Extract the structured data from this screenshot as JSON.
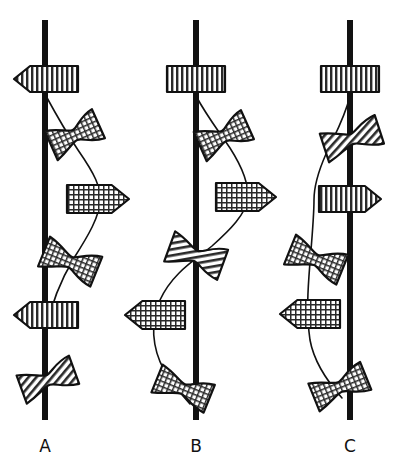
{
  "figure": {
    "type": "diagram",
    "title": "",
    "background_color": "#ffffff",
    "line_color": "#111111",
    "width": 398,
    "height": 464,
    "columns": [
      {
        "id": "A",
        "label": "A",
        "label_x": 45,
        "label_y": 452,
        "axis": {
          "x": 45,
          "y_top": 20,
          "y_bottom": 420,
          "width": 6
        },
        "elements": [
          {
            "name": "banded-block-left-arrow",
            "shape": "left-arrow-block",
            "pattern": "vertical-stripes",
            "cx": 46,
            "cy": 79,
            "w": 64,
            "h": 26,
            "rotate": 0
          },
          {
            "name": "grid-bowtie-upper",
            "shape": "bowtie",
            "pattern": "grid",
            "cx": 75,
            "cy": 135,
            "w": 52,
            "h": 32,
            "rotate": -24
          },
          {
            "name": "grid-block-right-arrow",
            "shape": "right-arrow-block",
            "pattern": "grid",
            "cx": 98,
            "cy": 199,
            "w": 62,
            "h": 28,
            "rotate": 0
          },
          {
            "name": "grid-bowtie-lower",
            "shape": "bowtie",
            "pattern": "grid",
            "cx": 70,
            "cy": 262,
            "w": 56,
            "h": 32,
            "rotate": 22
          },
          {
            "name": "banded-block-left-arrow-lower",
            "shape": "left-arrow-block",
            "pattern": "vertical-stripes",
            "cx": 46,
            "cy": 315,
            "w": 64,
            "h": 26,
            "rotate": 0
          },
          {
            "name": "hatched-bowtie-bottom",
            "shape": "bowtie",
            "pattern": "diagonal-hatch",
            "cx": 48,
            "cy": 380,
            "w": 56,
            "h": 30,
            "rotate": -20
          }
        ],
        "curve": "M 46 96 C 58 118, 66 132, 78 150 C 96 176, 100 186, 100 200 C 100 216, 88 236, 74 258 C 62 278, 52 300, 46 330 C 42 352, 42 368, 46 395"
      },
      {
        "id": "B",
        "label": "B",
        "label_x": 196,
        "label_y": 452,
        "axis": {
          "x": 196,
          "y_top": 20,
          "y_bottom": 420,
          "width": 6
        },
        "elements": [
          {
            "name": "banded-block-plain",
            "shape": "block",
            "pattern": "vertical-stripes",
            "cx": 196,
            "cy": 79,
            "w": 58,
            "h": 26,
            "rotate": 0
          },
          {
            "name": "grid-bowtie-upper",
            "shape": "bowtie",
            "pattern": "grid",
            "cx": 224,
            "cy": 136,
            "w": 52,
            "h": 32,
            "rotate": -24
          },
          {
            "name": "grid-block-right-arrow",
            "shape": "right-arrow-block",
            "pattern": "grid",
            "cx": 246,
            "cy": 197,
            "w": 60,
            "h": 28,
            "rotate": 0
          },
          {
            "name": "hatched-bowtie-mid",
            "shape": "bowtie",
            "pattern": "diagonal-hatch",
            "cx": 196,
            "cy": 256,
            "w": 56,
            "h": 32,
            "rotate": 20
          },
          {
            "name": "grid-block-left-arrow",
            "shape": "left-arrow-block",
            "pattern": "grid",
            "cx": 155,
            "cy": 315,
            "w": 60,
            "h": 28,
            "rotate": 0
          },
          {
            "name": "grid-bowtie-bottom",
            "shape": "bowtie",
            "pattern": "grid",
            "cx": 183,
            "cy": 389,
            "w": 56,
            "h": 30,
            "rotate": 22
          }
        ],
        "curve": "M 196 96 C 208 118, 218 130, 230 148 C 244 170, 248 184, 248 198 C 246 214, 230 230, 212 246 C 192 262, 172 274, 160 300 C 150 322, 152 348, 164 370 C 172 384, 180 392, 190 404"
      },
      {
        "id": "C",
        "label": "C",
        "label_x": 350,
        "label_y": 452,
        "axis": {
          "x": 350,
          "y_top": 20,
          "y_bottom": 420,
          "width": 6
        },
        "elements": [
          {
            "name": "banded-block-plain",
            "shape": "block",
            "pattern": "vertical-stripes",
            "cx": 350,
            "cy": 79,
            "w": 58,
            "h": 26,
            "rotate": 0
          },
          {
            "name": "hatched-bowtie-upper",
            "shape": "bowtie",
            "pattern": "diagonal-hatch",
            "cx": 352,
            "cy": 139,
            "w": 58,
            "h": 30,
            "rotate": -18
          },
          {
            "name": "banded-block-right-arrow",
            "shape": "right-arrow-block",
            "pattern": "vertical-stripes",
            "cx": 350,
            "cy": 199,
            "w": 62,
            "h": 26,
            "rotate": 0
          },
          {
            "name": "grid-bowtie-upper-left",
            "shape": "bowtie",
            "pattern": "grid",
            "cx": 316,
            "cy": 260,
            "w": 56,
            "h": 32,
            "rotate": 22
          },
          {
            "name": "grid-block-left-arrow",
            "shape": "left-arrow-block",
            "pattern": "grid",
            "cx": 310,
            "cy": 314,
            "w": 60,
            "h": 28,
            "rotate": 0
          },
          {
            "name": "grid-bowtie-bottom",
            "shape": "bowtie",
            "pattern": "grid",
            "cx": 340,
            "cy": 387,
            "w": 56,
            "h": 30,
            "rotate": -22
          }
        ],
        "curve": "M 350 96 C 344 120, 334 136, 326 154 C 318 172, 314 186, 314 200 C 314 216, 312 238, 310 262 C 308 288, 306 312, 310 340 C 314 362, 326 380, 342 398"
      }
    ]
  }
}
